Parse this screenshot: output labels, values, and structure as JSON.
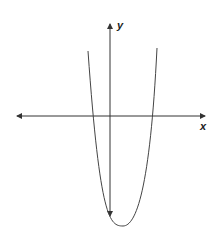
{
  "diagram": {
    "type": "parabola-graph",
    "axes": {
      "x_label": "x",
      "y_label": "y",
      "x_axis_double_arrow": true,
      "y_axis_double_arrow": true
    },
    "curve": {
      "shape": "upward-opening parabola",
      "vertex_position": "below x-axis, right of y-axis",
      "x_intercepts": "one negative, one positive",
      "y_intercept": "negative"
    },
    "colors": {
      "line": "#333333",
      "background": "#ffffff"
    }
  }
}
